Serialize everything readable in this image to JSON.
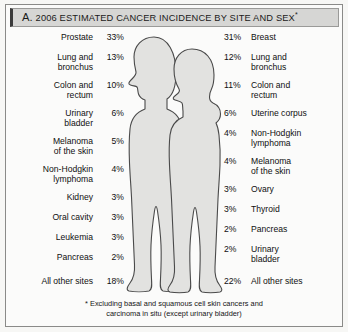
{
  "title": {
    "letter": "A.",
    "text": "2006 ESTIMATED CANCER INCIDENCE BY SITE AND SEX",
    "footnote_marker": "*"
  },
  "footnote": {
    "line1": "* Excluding basal and squamous cell skin cancers and",
    "line2": "carcinoma in situ (except urinary bladder)"
  },
  "figures": {
    "male": "male-silhouette",
    "female": "female-silhouette",
    "fill_color": "#e2e2e0",
    "stroke_color": "#4a4a4a"
  },
  "chart_data": {
    "type": "table",
    "title": "A. 2006 ESTIMATED CANCER INCIDENCE BY SITE AND SEX*",
    "xlabel": "",
    "ylabel": "Percent of estimated new cancer cases",
    "note": "* Excluding basal and squamous cell skin cancers and carcinoma in situ (except urinary bladder)",
    "legend": [
      "Male",
      "Female"
    ],
    "series": [
      {
        "name": "Male",
        "categories": [
          "Prostate",
          "Lung and bronchus",
          "Colon and rectum",
          "Urinary bladder",
          "Melanoma of the skin",
          "Non-Hodgkin lymphoma",
          "Kidney",
          "Oral cavity",
          "Leukemia",
          "Pancreas",
          "All other sites"
        ],
        "values": [
          33,
          13,
          10,
          6,
          5,
          4,
          3,
          3,
          3,
          2,
          18
        ],
        "value_labels": [
          "33%",
          "13%",
          "10%",
          "6%",
          "5%",
          "4%",
          "3%",
          "3%",
          "3%",
          "2%",
          "18%"
        ]
      },
      {
        "name": "Female",
        "categories": [
          "Breast",
          "Lung and bronchus",
          "Colon and rectum",
          "Uterine corpus",
          "Non-Hodgkin lymphoma",
          "Melanoma of the skin",
          "Ovary",
          "Thyroid",
          "Pancreas",
          "Urinary bladder",
          "All other sites"
        ],
        "values": [
          31,
          12,
          11,
          6,
          4,
          4,
          3,
          3,
          2,
          2,
          22
        ],
        "value_labels": [
          "31%",
          "12%",
          "11%",
          "6%",
          "4%",
          "4%",
          "3%",
          "3%",
          "2%",
          "2%",
          "22%"
        ]
      }
    ]
  },
  "male_rows": [
    {
      "label": "Prostate",
      "label2": "",
      "pct": "33%",
      "top": 3
    },
    {
      "label": "Lung and",
      "label2": "bronchus",
      "pct": "13%",
      "top": 23
    },
    {
      "label": "Colon and",
      "label2": "rectum",
      "pct": "10%",
      "top": 51
    },
    {
      "label": "Urinary",
      "label2": "bladder",
      "pct": "6%",
      "top": 79
    },
    {
      "label": "Melanoma",
      "label2": "of the skin",
      "pct": "5%",
      "top": 107
    },
    {
      "label": "Non-Hodgkin",
      "label2": "lymphoma",
      "pct": "4%",
      "top": 135
    },
    {
      "label": "Kidney",
      "label2": "",
      "pct": "3%",
      "top": 163
    },
    {
      "label": "Oral cavity",
      "label2": "",
      "pct": "3%",
      "top": 183
    },
    {
      "label": "Leukemia",
      "label2": "",
      "pct": "3%",
      "top": 203
    },
    {
      "label": "Pancreas",
      "label2": "",
      "pct": "2%",
      "top": 223
    },
    {
      "label": "All other sites",
      "label2": "",
      "pct": "18%",
      "top": 247
    }
  ],
  "female_rows": [
    {
      "label": "Breast",
      "label2": "",
      "pct": "31%",
      "top": 3
    },
    {
      "label": "Lung and",
      "label2": "bronchus",
      "pct": "12%",
      "top": 23
    },
    {
      "label": "Colon and",
      "label2": "rectum",
      "pct": "11%",
      "top": 51
    },
    {
      "label": "Uterine corpus",
      "label2": "",
      "pct": "6%",
      "top": 79
    },
    {
      "label": "Non-Hodgkin",
      "label2": "lymphoma",
      "pct": "4%",
      "top": 99
    },
    {
      "label": "Melanoma",
      "label2": "of the skin",
      "pct": "4%",
      "top": 127
    },
    {
      "label": "Ovary",
      "label2": "",
      "pct": "3%",
      "top": 155
    },
    {
      "label": "Thyroid",
      "label2": "",
      "pct": "3%",
      "top": 175
    },
    {
      "label": "Pancreas",
      "label2": "",
      "pct": "2%",
      "top": 195
    },
    {
      "label": "Urinary",
      "label2": "bladder",
      "pct": "2%",
      "top": 215
    },
    {
      "label": "All other sites",
      "label2": "",
      "pct": "22%",
      "top": 247
    }
  ]
}
